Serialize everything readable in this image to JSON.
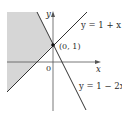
{
  "figure": {
    "type": "coordinate-region-diagram",
    "shaded_region": "y >= 1 + x and y >= 1 - 2x (left region)",
    "colors": {
      "shade": "#d6d6d6",
      "line": "#333333",
      "axis": "#555555"
    }
  },
  "axes": {
    "x_label": "x",
    "y_label": "y",
    "origin_label": "0"
  },
  "point": {
    "label": "(0, 1)"
  },
  "lines": [
    {
      "id": "line1",
      "equation": "y = 1 + x"
    },
    {
      "id": "line2",
      "equation": "y = 1 − 2x"
    }
  ]
}
